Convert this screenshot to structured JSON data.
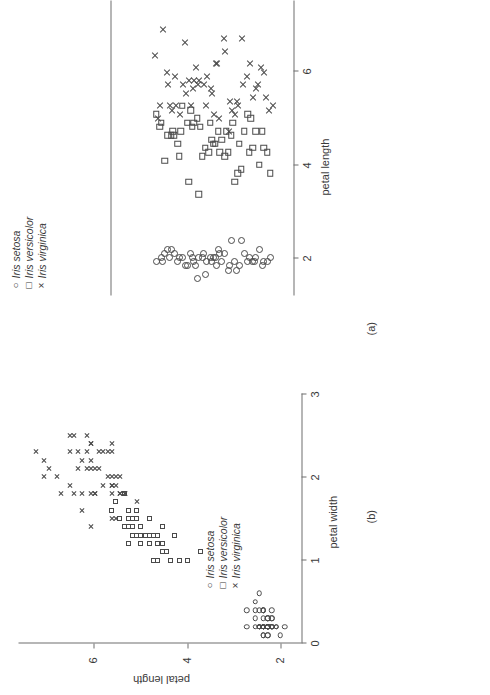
{
  "figure": {
    "background": "#ffffff",
    "ink_color": "#3a3a3a",
    "axis_color": "#6f6f6f"
  },
  "panels": {
    "a": {
      "label": "(a)",
      "axis_title": "petal length",
      "tick_labels": [
        "2",
        "4",
        "6"
      ],
      "legend": {
        "items": [
          {
            "glyph": "○",
            "marker": "circle",
            "label": "Iris setosa"
          },
          {
            "glyph": "□",
            "marker": "square",
            "label": "Iris versicolor"
          },
          {
            "glyph": "×",
            "marker": "cross",
            "label": "Iris virginica"
          }
        ]
      }
    },
    "b": {
      "label": "(b)",
      "x_axis_title": "petal width",
      "x_tick_labels": [
        "0",
        "1",
        "2",
        "3"
      ],
      "y_axis_title": "petal length",
      "y_tick_labels": [
        "2",
        "4",
        "6"
      ],
      "legend": {
        "items": [
          {
            "glyph": "○",
            "marker": "circle",
            "label": "Iris setosa"
          },
          {
            "glyph": "□",
            "marker": "square",
            "label": "Iris versicolor"
          },
          {
            "glyph": "×",
            "marker": "cross",
            "label": "Iris virginica"
          }
        ]
      }
    }
  },
  "chart_data": [
    {
      "id": "panel_a",
      "type": "scatter",
      "title": "(a)",
      "description": "One-dimensional strip (jitter) plot of petal length for three Iris species; vertical position is random jitter.",
      "xlabel": "petal length",
      "ylabel": "",
      "xlim": [
        0.6,
        7.6
      ],
      "ylim": [
        0,
        1
      ],
      "xticks": [
        2,
        4,
        6
      ],
      "grid": false,
      "legend_position": "top-left",
      "series": [
        {
          "name": "Iris setosa",
          "marker": "circle",
          "x": [
            1.4,
            1.4,
            1.3,
            1.5,
            1.4,
            1.7,
            1.4,
            1.5,
            1.4,
            1.5,
            1.5,
            1.6,
            1.4,
            1.1,
            1.2,
            1.5,
            1.3,
            1.4,
            1.7,
            1.5,
            1.7,
            1.5,
            1.0,
            1.7,
            1.9,
            1.6,
            1.6,
            1.5,
            1.4,
            1.6,
            1.6,
            1.5,
            1.5,
            1.4,
            1.5,
            1.2,
            1.3,
            1.4,
            1.3,
            1.5,
            1.3,
            1.3,
            1.3,
            1.6,
            1.9,
            1.4,
            1.6,
            1.4,
            1.5,
            1.4
          ],
          "y": [
            0.62,
            0.78,
            0.41,
            0.55,
            0.88,
            0.31,
            0.7,
            0.48,
            0.35,
            0.92,
            0.58,
            0.27,
            0.81,
            0.52,
            0.66,
            0.44,
            0.73,
            0.22,
            0.85,
            0.38,
            0.6,
            0.5,
            0.47,
            0.29,
            0.68,
            0.76,
            0.33,
            0.57,
            0.9,
            0.43,
            0.64,
            0.25,
            0.79,
            0.53,
            0.36,
            0.71,
            0.46,
            0.82,
            0.59,
            0.3,
            0.87,
            0.4,
            0.67,
            0.51,
            0.74,
            0.26,
            0.61,
            0.45,
            0.83,
            0.56
          ]
        },
        {
          "name": "Iris versicolor",
          "marker": "square",
          "x": [
            4.7,
            4.5,
            4.9,
            4.0,
            4.6,
            4.5,
            4.7,
            3.3,
            4.6,
            3.9,
            3.5,
            4.2,
            4.0,
            4.7,
            3.6,
            4.4,
            4.5,
            4.1,
            4.5,
            3.9,
            4.8,
            4.0,
            4.9,
            4.7,
            4.3,
            4.4,
            4.8,
            5.0,
            4.5,
            3.5,
            3.8,
            3.7,
            3.9,
            5.1,
            4.5,
            4.5,
            4.7,
            4.4,
            4.1,
            4.0,
            4.4,
            4.6,
            4.0,
            3.3,
            4.2,
            4.2,
            4.2,
            4.3,
            3.0,
            4.1
          ],
          "y": [
            0.55,
            0.32,
            0.78,
            0.61,
            0.44,
            0.87,
            0.25,
            0.7,
            0.49,
            0.36,
            0.92,
            0.58,
            0.66,
            0.41,
            0.74,
            0.29,
            0.83,
            0.52,
            0.37,
            0.64,
            0.47,
            0.9,
            0.22,
            0.69,
            0.56,
            0.33,
            0.8,
            0.43,
            0.6,
            0.72,
            0.27,
            0.85,
            0.5,
            0.38,
            0.76,
            0.65,
            0.45,
            0.31,
            0.88,
            0.54,
            0.68,
            0.24,
            0.79,
            0.42,
            0.57,
            0.35,
            0.73,
            0.62,
            0.48,
            0.81
          ]
        },
        {
          "name": "Iris virginica",
          "marker": "cross",
          "x": [
            6.0,
            5.1,
            5.9,
            5.6,
            5.8,
            6.6,
            4.5,
            6.3,
            5.8,
            6.1,
            5.1,
            5.3,
            5.5,
            5.0,
            5.1,
            5.3,
            5.5,
            6.7,
            6.9,
            5.0,
            5.7,
            4.9,
            6.7,
            4.9,
            5.7,
            6.0,
            4.8,
            4.9,
            5.6,
            5.8,
            6.1,
            6.4,
            5.6,
            5.1,
            5.6,
            6.1,
            5.6,
            5.5,
            4.8,
            5.4,
            5.6,
            5.1,
            5.1,
            5.9,
            5.7,
            5.2,
            5.0,
            5.2,
            5.4,
            5.1
          ],
          "y": [
            0.46,
            0.72,
            0.28,
            0.84,
            0.53,
            0.39,
            0.66,
            0.21,
            0.77,
            0.59,
            0.34,
            0.89,
            0.44,
            0.68,
            0.3,
            0.81,
            0.55,
            0.63,
            0.26,
            0.91,
            0.48,
            0.36,
            0.74,
            0.57,
            0.42,
            0.86,
            0.23,
            0.7,
            0.51,
            0.33,
            0.79,
            0.64,
            0.47,
            0.93,
            0.38,
            0.58,
            0.29,
            0.83,
            0.6,
            0.4,
            0.75,
            0.52,
            0.24,
            0.88,
            0.45,
            0.67,
            0.31,
            0.71,
            0.56,
            0.43
          ]
        }
      ]
    },
    {
      "id": "panel_b",
      "type": "scatter",
      "title": "(b)",
      "description": "Scatter plot of petal length versus petal width for three Iris species.",
      "xlabel": "petal width",
      "ylabel": "petal length",
      "xlim": [
        0,
        3
      ],
      "ylim": [
        0.6,
        7.3
      ],
      "xticks": [
        0,
        1,
        2,
        3
      ],
      "yticks": [
        2,
        4,
        6
      ],
      "grid": false,
      "legend_position": "upper-left-inside",
      "series": [
        {
          "name": "Iris setosa",
          "marker": "circle",
          "x": [
            0.2,
            0.2,
            0.2,
            0.2,
            0.2,
            0.4,
            0.3,
            0.2,
            0.2,
            0.1,
            0.2,
            0.2,
            0.1,
            0.1,
            0.2,
            0.4,
            0.4,
            0.3,
            0.3,
            0.3,
            0.2,
            0.4,
            0.2,
            0.5,
            0.2,
            0.2,
            0.4,
            0.2,
            0.2,
            0.2,
            0.2,
            0.4,
            0.1,
            0.2,
            0.2,
            0.2,
            0.2,
            0.1,
            0.2,
            0.2,
            0.3,
            0.3,
            0.2,
            0.6,
            0.4,
            0.3,
            0.2,
            0.2,
            0.2,
            0.2
          ],
          "y": [
            1.4,
            1.4,
            1.3,
            1.5,
            1.4,
            1.7,
            1.4,
            1.5,
            1.4,
            1.5,
            1.5,
            1.6,
            1.4,
            1.1,
            1.2,
            1.5,
            1.3,
            1.4,
            1.7,
            1.5,
            1.7,
            1.5,
            1.0,
            1.7,
            1.9,
            1.6,
            1.6,
            1.5,
            1.4,
            1.6,
            1.6,
            1.5,
            1.5,
            1.4,
            1.5,
            1.2,
            1.3,
            1.4,
            1.3,
            1.5,
            1.3,
            1.3,
            1.3,
            1.6,
            1.9,
            1.4,
            1.6,
            1.4,
            1.5,
            1.4
          ]
        },
        {
          "name": "Iris versicolor",
          "marker": "square",
          "x": [
            1.4,
            1.5,
            1.5,
            1.3,
            1.5,
            1.3,
            1.6,
            1.0,
            1.3,
            1.4,
            1.0,
            1.5,
            1.0,
            1.4,
            1.3,
            1.4,
            1.5,
            1.0,
            1.5,
            1.1,
            1.8,
            1.3,
            1.5,
            1.2,
            1.3,
            1.4,
            1.4,
            1.7,
            1.5,
            1.0,
            1.1,
            1.0,
            1.2,
            1.6,
            1.5,
            1.6,
            1.5,
            1.3,
            1.3,
            1.3,
            1.2,
            1.4,
            1.2,
            1.0,
            1.3,
            1.2,
            1.3,
            1.3,
            1.1,
            1.3
          ],
          "y": [
            4.7,
            4.5,
            4.9,
            4.0,
            4.6,
            4.5,
            4.7,
            3.3,
            4.6,
            3.9,
            3.5,
            4.2,
            4.0,
            4.7,
            3.6,
            4.4,
            4.5,
            4.1,
            4.5,
            3.9,
            4.8,
            4.0,
            4.9,
            4.7,
            4.3,
            4.4,
            4.8,
            5.0,
            4.5,
            3.5,
            3.8,
            3.7,
            3.9,
            5.1,
            4.5,
            4.5,
            4.7,
            4.4,
            4.1,
            4.0,
            4.4,
            4.6,
            4.0,
            3.3,
            4.2,
            4.2,
            4.2,
            4.3,
            3.0,
            4.1
          ]
        },
        {
          "name": "Iris virginica",
          "marker": "cross",
          "x": [
            2.5,
            1.9,
            2.1,
            1.8,
            2.2,
            2.1,
            1.7,
            1.8,
            1.8,
            2.5,
            2.0,
            1.9,
            2.1,
            2.0,
            2.4,
            2.3,
            1.8,
            2.2,
            2.3,
            1.5,
            2.3,
            2.0,
            2.0,
            1.8,
            2.1,
            1.8,
            1.8,
            1.8,
            2.1,
            1.6,
            1.9,
            2.0,
            2.2,
            1.5,
            1.4,
            2.3,
            2.4,
            1.8,
            1.8,
            2.1,
            2.4,
            2.3,
            1.9,
            2.3,
            2.5,
            2.3,
            1.9,
            2.0,
            2.3,
            1.8
          ],
          "y": [
            6.0,
            5.1,
            5.9,
            5.6,
            5.8,
            6.6,
            4.5,
            6.3,
            5.8,
            6.1,
            5.1,
            5.3,
            5.5,
            5.0,
            5.1,
            5.3,
            5.5,
            6.7,
            6.9,
            5.0,
            5.7,
            4.9,
            6.7,
            4.9,
            5.7,
            6.0,
            4.8,
            4.9,
            5.6,
            5.8,
            6.1,
            6.4,
            5.6,
            5.1,
            5.6,
            6.1,
            5.6,
            5.5,
            4.8,
            5.4,
            5.6,
            5.1,
            5.1,
            5.9,
            5.7,
            5.2,
            5.0,
            5.2,
            5.4,
            5.1
          ]
        }
      ]
    }
  ]
}
